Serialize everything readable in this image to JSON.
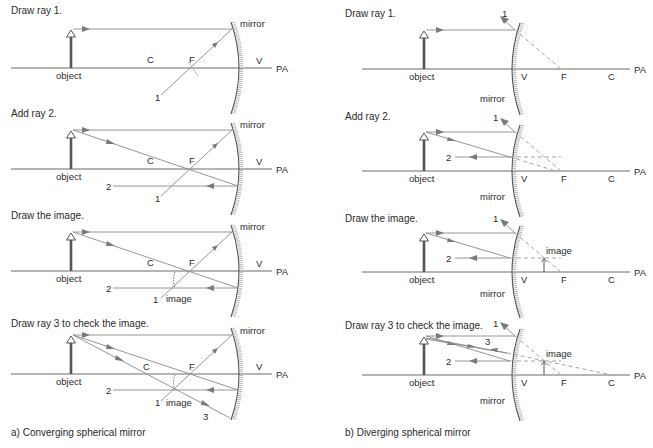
{
  "figure": {
    "panels_left": [
      {
        "step": "Draw ray 1.",
        "labels": {
          "object": "object",
          "C": "C",
          "F": "F",
          "V": "V",
          "PA": "PA",
          "mirror": "mirror",
          "ray1": "1"
        }
      },
      {
        "step": "Add ray 2.",
        "labels": {
          "object": "object",
          "C": "C",
          "F": "F",
          "V": "V",
          "PA": "PA",
          "mirror": "mirror",
          "ray1": "1",
          "ray2": "2"
        }
      },
      {
        "step": "Draw the image.",
        "labels": {
          "object": "object",
          "C": "C",
          "F": "F",
          "V": "V",
          "PA": "PA",
          "mirror": "mirror",
          "ray1": "1",
          "ray2": "2",
          "image": "image"
        }
      },
      {
        "step": "Draw ray 3 to check the image.",
        "labels": {
          "object": "object",
          "C": "C",
          "F": "F",
          "V": "V",
          "PA": "PA",
          "mirror": "mirror",
          "ray1": "1",
          "ray2": "2",
          "ray3": "3",
          "image": "image"
        }
      }
    ],
    "panels_right": [
      {
        "step": "Draw ray 1.",
        "labels": {
          "object": "object",
          "V": "V",
          "F": "F",
          "C": "C",
          "PA": "PA",
          "mirror": "mirror",
          "ray1": "1"
        }
      },
      {
        "step": "Add ray 2.",
        "labels": {
          "object": "object",
          "V": "V",
          "F": "F",
          "C": "C",
          "PA": "PA",
          "mirror": "mirror",
          "ray1": "1",
          "ray2": "2"
        }
      },
      {
        "step": "Draw the image.",
        "labels": {
          "object": "object",
          "V": "V",
          "F": "F",
          "C": "C",
          "PA": "PA",
          "mirror": "mirror",
          "ray1": "1",
          "ray2": "2",
          "image": "image"
        }
      },
      {
        "step": "Draw ray 3 to check the image.",
        "labels": {
          "object": "object",
          "V": "V",
          "F": "F",
          "C": "C",
          "PA": "PA",
          "mirror": "mirror",
          "ray1": "1",
          "ray2": "2",
          "ray3": "3",
          "image": "image"
        }
      }
    ],
    "captions": {
      "left": "a)  Converging spherical mirror",
      "right": "b)  Diverging spherical mirror"
    }
  }
}
